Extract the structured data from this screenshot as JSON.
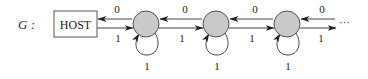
{
  "graph": {
    "name_label": "G :",
    "host_label": "HOST",
    "ellipsis": "···",
    "node_count_visible": 3,
    "edge_labels": {
      "leftward": "0",
      "rightward": "1",
      "self_loop": "1"
    },
    "nodes": [
      {
        "id": "node-1",
        "cx": 146
      },
      {
        "id": "node-2",
        "cx": 216
      },
      {
        "id": "node-3",
        "cx": 287
      }
    ],
    "colors": {
      "node_fill": "#c9c9c9",
      "stroke": "#444444"
    }
  }
}
